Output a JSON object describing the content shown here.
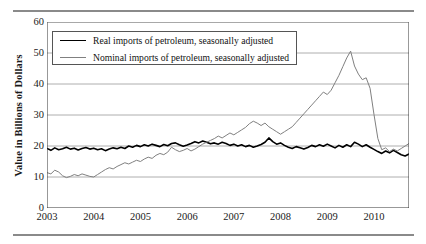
{
  "figure": {
    "ylabel": "Value in Billions of Dollars",
    "legend": {
      "items": [
        {
          "label": "Real imports of petroleum, seasonally adjusted",
          "color": "#000000",
          "style": "thick"
        },
        {
          "label": "Nominal imports of petroleum, seasonally adjusted",
          "color": "#808080",
          "style": "thin"
        }
      ]
    }
  },
  "chart_data": {
    "type": "line",
    "title": "",
    "xlabel": "",
    "ylabel": "Value in Billions of Dollars",
    "xlim": [
      2003.0,
      2010.75
    ],
    "ylim": [
      0,
      60
    ],
    "yticks": [
      0,
      10,
      20,
      30,
      40,
      50,
      60
    ],
    "xticks": [
      2003,
      2004,
      2005,
      2006,
      2007,
      2008,
      2009,
      2010
    ],
    "xtick_labels": [
      "2003",
      "2004",
      "2005",
      "2006",
      "2007",
      "2008",
      "2009",
      "2010"
    ],
    "minor_xticks": "monthly",
    "grid": "horizontal",
    "legend_position": "upper-left",
    "x_start": 2003.0,
    "x_step": 0.08333,
    "series": [
      {
        "name": "Real imports of petroleum, seasonally adjusted",
        "color": "#000000",
        "width": 1.6,
        "values": [
          19.2,
          18.6,
          19.4,
          18.8,
          19.1,
          19.6,
          19.0,
          19.3,
          18.7,
          19.2,
          19.5,
          19.0,
          19.3,
          18.8,
          19.1,
          18.5,
          19.0,
          19.4,
          19.1,
          19.6,
          19.2,
          20.0,
          19.6,
          20.2,
          19.8,
          20.4,
          20.0,
          20.6,
          20.2,
          19.8,
          20.5,
          20.1,
          20.8,
          21.0,
          20.4,
          19.9,
          20.3,
          20.8,
          21.4,
          21.0,
          21.6,
          21.2,
          20.7,
          21.0,
          20.6,
          21.2,
          20.8,
          20.2,
          20.6,
          20.0,
          20.4,
          19.8,
          20.2,
          19.6,
          20.0,
          20.5,
          21.2,
          22.6,
          21.4,
          20.6,
          21.0,
          20.2,
          19.6,
          19.2,
          19.8,
          19.4,
          19.0,
          19.5,
          20.2,
          19.8,
          20.4,
          19.9,
          20.6,
          20.0,
          19.4,
          20.2,
          19.6,
          20.4,
          19.8,
          21.2,
          20.6,
          19.8,
          20.4,
          19.6,
          18.9,
          18.2,
          17.6,
          18.4,
          17.8,
          18.6,
          17.9,
          17.2,
          16.8,
          17.4,
          16.9,
          17.6,
          17.0,
          17.8,
          17.2,
          18.0,
          17.4,
          18.2,
          17.6,
          18.4,
          17.8,
          18.6,
          18.0,
          18.8,
          18.2,
          18.0,
          18.6,
          18.2,
          18.8,
          18.4,
          19.0,
          18.6,
          19.2,
          18.8
        ]
      },
      {
        "name": "Nominal imports of petroleum, seasonally adjusted",
        "color": "#808080",
        "width": 1.0,
        "values": [
          11.4,
          11.0,
          12.2,
          11.6,
          10.4,
          9.8,
          10.2,
          10.8,
          10.4,
          11.0,
          10.6,
          10.2,
          10.0,
          10.8,
          11.6,
          12.4,
          13.0,
          12.6,
          13.4,
          14.0,
          14.6,
          14.2,
          14.8,
          15.4,
          15.0,
          15.8,
          16.4,
          16.0,
          17.0,
          17.6,
          17.2,
          18.0,
          19.6,
          18.8,
          18.2,
          18.6,
          19.2,
          18.4,
          19.0,
          19.8,
          20.6,
          21.2,
          21.8,
          22.4,
          23.2,
          22.6,
          23.4,
          24.2,
          23.6,
          24.4,
          25.2,
          26.0,
          27.2,
          28.0,
          27.4,
          26.6,
          27.4,
          26.2,
          25.4,
          24.6,
          23.8,
          24.6,
          25.4,
          26.2,
          27.6,
          29.0,
          30.4,
          31.8,
          33.2,
          34.6,
          36.0,
          37.4,
          36.6,
          38.0,
          40.4,
          42.8,
          45.6,
          48.4,
          50.6,
          45.8,
          43.2,
          41.4,
          42.0,
          38.6,
          30.2,
          22.4,
          18.8,
          19.4,
          18.2,
          19.0,
          18.4,
          19.2,
          20.0,
          20.8,
          21.6,
          22.4,
          23.2,
          22.4,
          23.0,
          24.6,
          23.8,
          25.2,
          26.0,
          27.2,
          26.4,
          27.8,
          28.6,
          29.4,
          28.2,
          27.0,
          26.2,
          27.4,
          28.2,
          29.0,
          28.4,
          29.2,
          29.8,
          28.6
        ]
      }
    ]
  },
  "axes": {
    "ytick_labels": [
      "60",
      "50",
      "40",
      "30",
      "20",
      "10",
      "0"
    ],
    "xtick_labels": [
      "2003",
      "2004",
      "2005",
      "2006",
      "2007",
      "2008",
      "2009",
      "2010"
    ]
  }
}
